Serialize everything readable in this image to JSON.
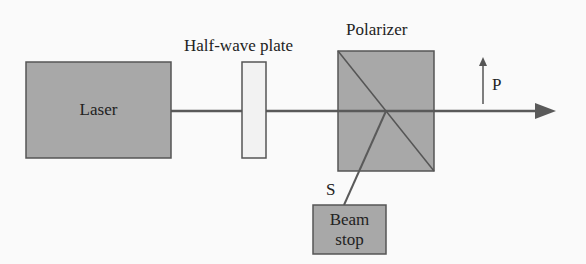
{
  "diagram": {
    "type": "optical-setup",
    "components": {
      "laser": {
        "label": "Laser"
      },
      "half_wave_plate": {
        "label": "Half-wave plate"
      },
      "polarizer": {
        "label": "Polarizer"
      },
      "beam_stop": {
        "label_line1": "Beam",
        "label_line2": "stop"
      }
    },
    "beams": {
      "p_label": "P",
      "s_label": "S"
    },
    "colors": {
      "component_fill": "#a8a8a8",
      "plate_fill": "#f2f2f2",
      "stroke": "#555555",
      "background": "#fafafa"
    }
  }
}
